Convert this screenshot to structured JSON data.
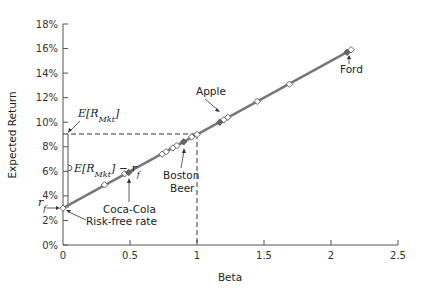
{
  "chart_data": {
    "type": "scatter",
    "title": "",
    "xlabel": "Beta",
    "ylabel": "Expected Return",
    "xlim": [
      0,
      2.5
    ],
    "ylim": [
      0,
      18
    ],
    "x_ticks": [
      "0",
      "0.5",
      "1",
      "1.5",
      "2",
      "2.5"
    ],
    "y_ticks": [
      "0%",
      "2%",
      "4%",
      "6%",
      "8%",
      "10%",
      "12%",
      "14%",
      "16%",
      "18%"
    ],
    "grid": false,
    "legend": null,
    "line": {
      "name": "Security Market Line",
      "x": [
        0,
        2.15
      ],
      "y": [
        3.0,
        15.9
      ],
      "color": "#777777"
    },
    "series": [
      {
        "name": "Stocks",
        "x": [
          0,
          0.31,
          0.46,
          0.49,
          0.74,
          0.77,
          0.82,
          0.85,
          0.9,
          0.96,
          1.0,
          1.17,
          1.2,
          1.23,
          1.45,
          1.69,
          2.12,
          2.15
        ],
        "y": [
          3.0,
          4.9,
          5.8,
          5.9,
          7.4,
          7.6,
          7.9,
          8.1,
          8.4,
          8.8,
          9.0,
          10.0,
          10.2,
          10.4,
          11.7,
          13.1,
          15.7,
          15.9
        ],
        "filled": [
          false,
          false,
          false,
          true,
          false,
          false,
          false,
          false,
          true,
          false,
          false,
          true,
          false,
          false,
          false,
          false,
          true,
          false
        ]
      }
    ],
    "annotations": [
      {
        "text": "Ford",
        "x": 2.13,
        "y": 15.7
      },
      {
        "text": "Apple",
        "x": 1.17,
        "y": 10.0
      },
      {
        "text": "Boston Beer",
        "x": 0.9,
        "y": 8.4
      },
      {
        "text": "Coca-Cola",
        "x": 0.49,
        "y": 5.9
      },
      {
        "text": "Risk-free rate",
        "x": 0,
        "y": 3.0
      },
      {
        "text": "E[R_Mkt]",
        "x": 0,
        "y": 9.0
      },
      {
        "text": "E[R_Mkt] − r_f",
        "x": 0,
        "y": 6.0
      },
      {
        "text": "r_f",
        "x": 0,
        "y": 3.0
      }
    ],
    "reference_lines": [
      {
        "type": "horizontal",
        "y": 9.0,
        "x_range": [
          0,
          1
        ],
        "style": "dashed"
      },
      {
        "type": "vertical",
        "x": 1.0,
        "y_range": [
          0,
          9
        ],
        "style": "dashed"
      }
    ]
  },
  "labels": {
    "xlabel": "Beta",
    "ylabel": "Expected Return",
    "ford": "Ford",
    "apple": "Apple",
    "boston1": "Boston",
    "boston2": "Beer",
    "coca": "Coca-Cola",
    "riskfree": "Risk-free rate",
    "emkt_E": "E[R",
    "emkt_sub": "Mkt",
    "emkt_close": "]",
    "prem_minus": "] − r",
    "rf_r": "r",
    "rf_sub": "f"
  }
}
